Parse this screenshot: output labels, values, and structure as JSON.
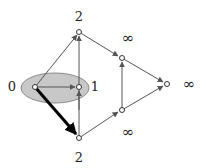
{
  "diagram": {
    "nodes": [
      {
        "id": "s",
        "label": "0",
        "x": 35,
        "y": 87
      },
      {
        "id": "a",
        "label": "1",
        "x": 79,
        "y": 87
      },
      {
        "id": "t",
        "label": "2",
        "x": 79,
        "y": 32
      },
      {
        "id": "b",
        "label": "2",
        "x": 79,
        "y": 138
      },
      {
        "id": "c",
        "label": "∞",
        "x": 122,
        "y": 58
      },
      {
        "id": "d",
        "label": "∞",
        "x": 122,
        "y": 110
      },
      {
        "id": "e",
        "label": "∞",
        "x": 167,
        "y": 84
      }
    ],
    "labels": {
      "node_s": "0",
      "node_a": "1",
      "node_t": "2",
      "node_b": "2",
      "node_c": "∞",
      "node_d": "∞",
      "node_e": "∞"
    },
    "highlight_set": [
      "s",
      "a"
    ],
    "highlighted_edge": {
      "from": "s",
      "to": "b"
    },
    "colors": {
      "ellipse_fill": "#c8c8c8",
      "ellipse_stroke": "#8a8a8a",
      "edge": "#555555",
      "highlight_edge": "#000000"
    }
  }
}
